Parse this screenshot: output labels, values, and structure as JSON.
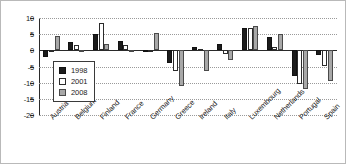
{
  "chart_data": {
    "type": "bar",
    "title": "",
    "subtitle": "",
    "xlabel": "",
    "ylabel": "",
    "ylim": [
      -20,
      10
    ],
    "yticks": [
      10,
      5,
      0,
      -5,
      -10,
      -15,
      -20
    ],
    "ytick_labels": [
      "10",
      "5",
      "0",
      "-5",
      "-10",
      "-15",
      "-20"
    ],
    "grid": true,
    "grid_style": "dotted-horizontal",
    "legend_position": "inside-lower-left",
    "categories": [
      "Austria",
      "Belgium",
      "Finland",
      "France",
      "Germany",
      "Greece",
      "Ireland",
      "Italy",
      "Luxembourg",
      "Netherlands",
      "Portugal",
      "Spain"
    ],
    "series": [
      {
        "name": "1998",
        "color": "#1c1c1c",
        "values": [
          -2.0,
          2.5,
          5.0,
          3.0,
          -0.5,
          -4.0,
          1.0,
          2.0,
          7.0,
          4.0,
          -8.0,
          -1.5
        ]
      },
      {
        "name": "2001",
        "color": "#ffffff",
        "values": [
          -0.5,
          1.5,
          8.5,
          1.5,
          -0.5,
          -6.5,
          0.5,
          -1.0,
          7.0,
          1.0,
          -10.5,
          -5.0
        ]
      },
      {
        "name": "2008",
        "color": "#a8a8a8",
        "values": [
          4.5,
          -0.5,
          2.0,
          -0.5,
          5.5,
          -11.0,
          -6.5,
          -3.0,
          7.5,
          5.0,
          -12.0,
          -9.5
        ]
      }
    ]
  },
  "legend": {
    "entries": [
      {
        "label": "1998"
      },
      {
        "label": "2001"
      },
      {
        "label": "2008"
      }
    ]
  }
}
